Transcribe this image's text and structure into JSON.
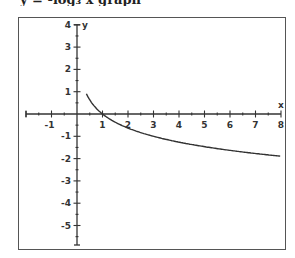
{
  "header_fragment": "y = -log₃ x graph",
  "chart_data": {
    "type": "line",
    "title": "",
    "xlabel": "x",
    "ylabel": "y",
    "xlim": [
      -2.0,
      8
    ],
    "ylim": [
      -6,
      4
    ],
    "grid": false,
    "x_ticks": [
      -1,
      1,
      2,
      3,
      4,
      5,
      6,
      7,
      8
    ],
    "y_ticks": [
      4,
      3,
      2,
      1,
      -1,
      -2,
      -3,
      -4,
      -5
    ],
    "series": [
      {
        "name": "curve",
        "function": "y = -log3(x)",
        "x": [
          0.37,
          0.5,
          0.75,
          1,
          1.5,
          2,
          3,
          4,
          5,
          6,
          7,
          8
        ],
        "values": [
          0.9,
          0.63,
          0.26,
          0,
          -0.37,
          -0.63,
          -1,
          -1.26,
          -1.46,
          -1.63,
          -1.77,
          -1.89
        ]
      }
    ]
  }
}
